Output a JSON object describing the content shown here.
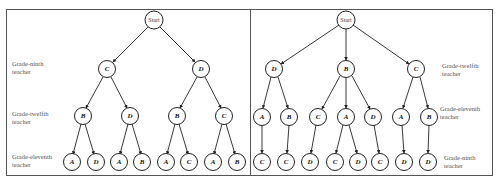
{
  "panels": [
    {
      "id": "left",
      "levels": [
        {
          "label_line1": "Grade-ninth",
          "label_line2": "teacher"
        },
        {
          "label_line1": "Grade-twelfth",
          "label_line2": "teacher"
        },
        {
          "label_line1": "Grade-eleventh",
          "label_line2": "teacher"
        }
      ],
      "start_label": "Start",
      "level1": [
        "C",
        "D"
      ],
      "level2": [
        "B",
        "D",
        "B",
        "C"
      ],
      "level3": [
        "A",
        "D",
        "A",
        "B",
        "A",
        "C",
        "A",
        "B"
      ]
    },
    {
      "id": "right",
      "levels": [
        {
          "label_line1": "Grade-twelfth",
          "label_line2": "teacher"
        },
        {
          "label_line1": "Grade-eleventh",
          "label_line2": "teacher"
        },
        {
          "label_line1": "Grade-ninth",
          "label_line2": "teacher"
        }
      ],
      "start_label": "Start",
      "level1": [
        "D",
        "B",
        "C"
      ],
      "level2": [
        "A",
        "B",
        "C",
        "A",
        "D",
        "A",
        "B"
      ],
      "level3": [
        "C",
        "C",
        "D",
        "C",
        "D",
        "C",
        "D",
        "D"
      ]
    }
  ]
}
